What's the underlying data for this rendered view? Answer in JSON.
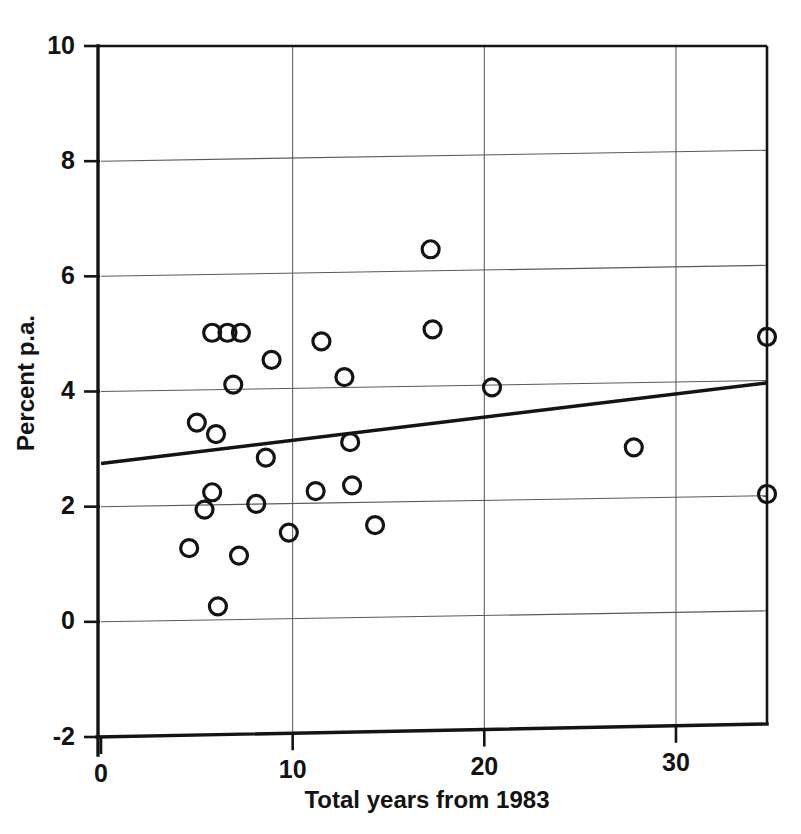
{
  "chart_data": {
    "type": "scatter",
    "title": "",
    "subtitle": "",
    "xlabel": "Total years from 1983",
    "ylabel": "Percent p.a.",
    "xlim": [
      0,
      34.75
    ],
    "ylim": [
      -2,
      10
    ],
    "xticks": [
      0,
      10,
      20,
      30
    ],
    "xtick_labels": [
      "0",
      "10",
      "20",
      "30"
    ],
    "yticks": [
      -2,
      0,
      2,
      4,
      6,
      8,
      10
    ],
    "ytick_labels": [
      "-2",
      "0",
      "2",
      "4",
      "6",
      "8",
      "10"
    ],
    "grid": true,
    "grid_axes": "both",
    "legend": false,
    "legend_position": "none",
    "marker": "open-circle",
    "marker_color": "#131313",
    "marker_size": 11,
    "line_color": "#131313",
    "points": [
      {
        "x": 4.6,
        "y": 1.28
      },
      {
        "x": 5.0,
        "y": 3.46
      },
      {
        "x": 5.4,
        "y": 1.95
      },
      {
        "x": 5.8,
        "y": 5.02
      },
      {
        "x": 5.8,
        "y": 2.25
      },
      {
        "x": 6.1,
        "y": 0.27
      },
      {
        "x": 6.0,
        "y": 3.26
      },
      {
        "x": 6.6,
        "y": 5.02
      },
      {
        "x": 6.9,
        "y": 4.12
      },
      {
        "x": 7.2,
        "y": 1.15
      },
      {
        "x": 7.3,
        "y": 5.02
      },
      {
        "x": 8.1,
        "y": 2.05
      },
      {
        "x": 8.6,
        "y": 2.85
      },
      {
        "x": 8.9,
        "y": 4.55
      },
      {
        "x": 9.8,
        "y": 1.55
      },
      {
        "x": 11.2,
        "y": 2.27
      },
      {
        "x": 11.5,
        "y": 4.87
      },
      {
        "x": 12.7,
        "y": 4.25
      },
      {
        "x": 13.0,
        "y": 3.12
      },
      {
        "x": 13.1,
        "y": 2.37
      },
      {
        "x": 14.3,
        "y": 1.68
      },
      {
        "x": 17.2,
        "y": 6.47
      },
      {
        "x": 17.3,
        "y": 5.08
      },
      {
        "x": 20.4,
        "y": 4.07
      },
      {
        "x": 27.8,
        "y": 3.03
      },
      {
        "x": 34.75,
        "y": 4.95
      },
      {
        "x": 34.75,
        "y": 2.22
      }
    ],
    "trendline": {
      "type": "linear-fit",
      "x_start": 0,
      "y_start": 2.75,
      "x_end": 34.75,
      "y_end": 4.15,
      "slope": 0.0403,
      "intercept": 2.75
    }
  }
}
